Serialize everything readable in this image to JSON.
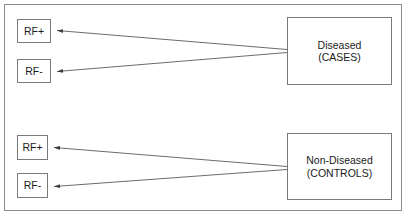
{
  "diagram": {
    "background_color": "#ffffff",
    "frame_color": "#8d8d8d",
    "box_border_color": "#7a7a7a",
    "line_color": "#5a5a5a",
    "text_color": "#1b1b1b",
    "groups": [
      {
        "id": "cases-group",
        "outcome": {
          "name": "outcome-cases",
          "line1": "Diseased",
          "line2": "(CASES)"
        },
        "exposures": [
          {
            "name": "exposure-rf-positive-cases",
            "label": "RF+"
          },
          {
            "name": "exposure-rf-negative-cases",
            "label": "RF-"
          }
        ]
      },
      {
        "id": "controls-group",
        "outcome": {
          "name": "outcome-controls",
          "line1": "Non-Diseased",
          "line2": "(CONTROLS)"
        },
        "exposures": [
          {
            "name": "exposure-rf-positive-controls",
            "label": "RF+"
          },
          {
            "name": "exposure-rf-negative-controls",
            "label": "RF-"
          }
        ]
      }
    ],
    "arrows": [
      {
        "name": "arrow-cases-to-rf-positive",
        "from": "outcome-cases",
        "to": "exposure-rf-positive-cases"
      },
      {
        "name": "arrow-cases-to-rf-negative",
        "from": "outcome-cases",
        "to": "exposure-rf-negative-cases"
      },
      {
        "name": "arrow-controls-to-rf-positive",
        "from": "outcome-controls",
        "to": "exposure-rf-positive-controls"
      },
      {
        "name": "arrow-controls-to-rf-negative",
        "from": "outcome-controls",
        "to": "exposure-rf-negative-controls"
      }
    ]
  }
}
